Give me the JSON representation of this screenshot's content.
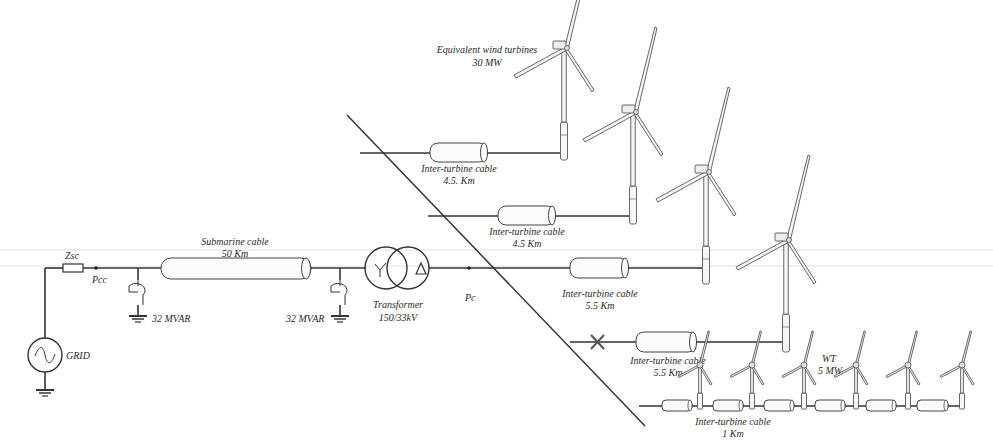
{
  "diagram": {
    "title_group": {
      "line1": "Equivalent wind turbines",
      "line2": "30 MW"
    },
    "grid": {
      "label": "GRID"
    },
    "impedance": {
      "label": "Zsc"
    },
    "pcc": {
      "label": "Pcc"
    },
    "pc": {
      "label": "Pc"
    },
    "compensator_left": {
      "label": "32 MVAR"
    },
    "compensator_right": {
      "label": "32 MVAR"
    },
    "submarine_cable": {
      "line1": "Submarine cable",
      "line2": "50 Km"
    },
    "transformer": {
      "line1": "Transformer",
      "line2": "150/33kV",
      "primary_symbol": "Y",
      "secondary_symbol": "Δ"
    },
    "feeders": [
      {
        "cable_line1": "Inter-turbine cable",
        "cable_line2": "4.5. Km"
      },
      {
        "cable_line1": "Inter-turbine cable",
        "cable_line2": "4.5 Km"
      },
      {
        "cable_line1": "Inter-turbine cable",
        "cable_line2": "5.5 Km"
      },
      {
        "cable_line1": "Inter-turbine cable",
        "cable_line2": "5.5 Km",
        "breaker": "open"
      }
    ],
    "string_feeder": {
      "cable_line1": "Inter-turbine cable",
      "cable_line2": "1 Km",
      "turbine_line1": "WT",
      "turbine_line2": "5 MW",
      "turbine_count": 6
    },
    "colors": {
      "line": "#333333",
      "background": "#ffffff"
    }
  }
}
